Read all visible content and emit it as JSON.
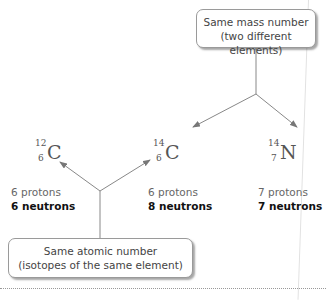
{
  "boxes": {
    "top": {
      "line1": "Same mass number",
      "line2": "(two different elements)"
    },
    "bottom": {
      "line1": "Same atomic number",
      "line2": "(isotopes of the same element)"
    }
  },
  "nuclides": [
    {
      "mass": "12",
      "z": "6",
      "symbol": "C",
      "protons": "6 protons",
      "neutrons": "6 neutrons"
    },
    {
      "mass": "14",
      "z": "6",
      "symbol": "C",
      "protons": "6 protons",
      "neutrons": "8 neutrons"
    },
    {
      "mass": "14",
      "z": "7",
      "symbol": "N",
      "protons": "7 protons",
      "neutrons": "7 neutrons"
    }
  ],
  "colors": {
    "arrow": "#777777",
    "box_border": "#9a9a9a"
  }
}
